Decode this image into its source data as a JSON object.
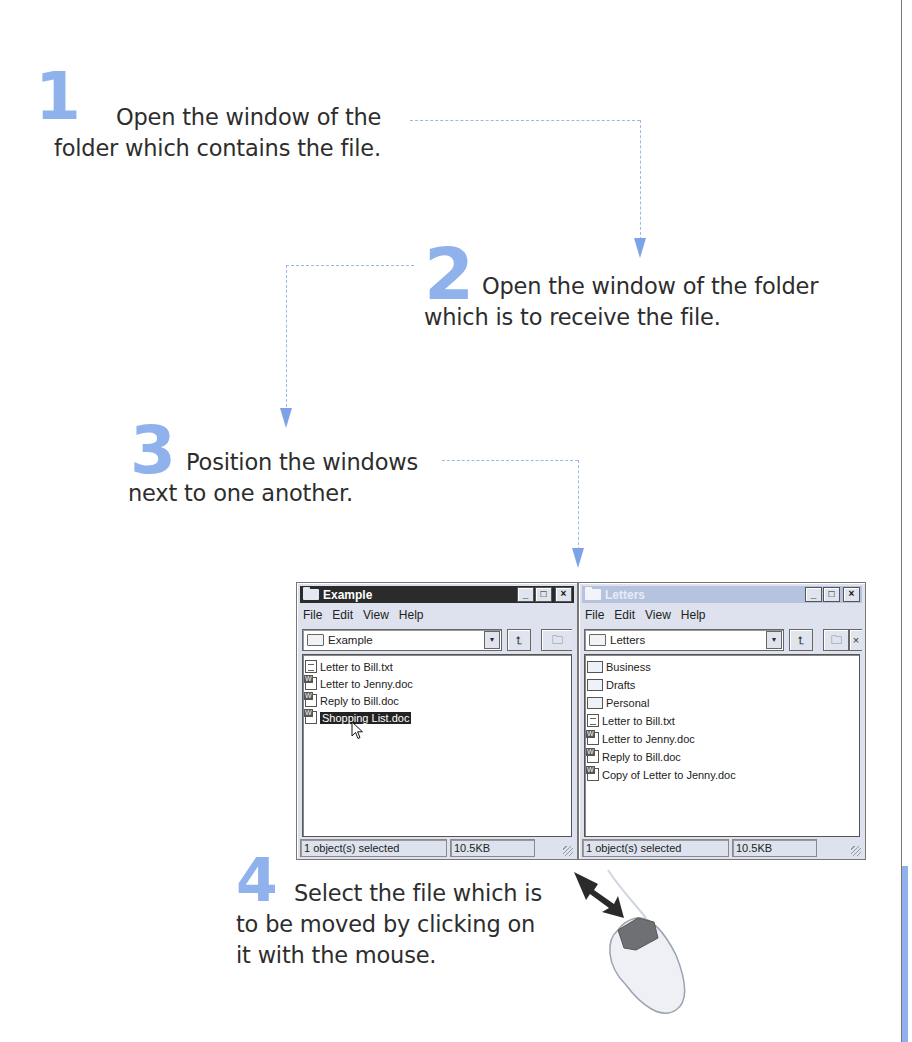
{
  "steps": [
    {
      "number": "1",
      "text_line1": "Open the window of the",
      "text_line2": "folder which contains the file."
    },
    {
      "number": "2",
      "text_line1": "Open the window of the folder",
      "text_line2": "which is to receive the file."
    },
    {
      "number": "3",
      "text_line1": "Position the windows",
      "text_line2": "next to one another."
    },
    {
      "number": "4",
      "text_line1": "Select the file which is",
      "text_line2": "to be moved by clicking on",
      "text_line3": "it with the mouse."
    }
  ],
  "colors": {
    "accent_blue": "#8fb2ec",
    "dashed_line": "#9db8e4",
    "active_titlebar": "#2b2b2b",
    "inactive_titlebar": "#b6c3de",
    "selection": "#222222"
  },
  "windows": [
    {
      "title": "Example",
      "state": "active",
      "menu": [
        "File",
        "Edit",
        "View",
        "Help"
      ],
      "address": "Example",
      "files": [
        {
          "name": "Letter to Bill.txt",
          "type": "txt"
        },
        {
          "name": "Letter to Jenny.doc",
          "type": "doc"
        },
        {
          "name": "Reply to Bill.doc",
          "type": "doc"
        },
        {
          "name": "Shopping List.doc",
          "type": "doc",
          "selected": true
        }
      ],
      "status_left": "1 object(s) selected",
      "status_size": "10.5KB"
    },
    {
      "title": "Letters",
      "state": "inactive",
      "menu": [
        "File",
        "Edit",
        "View",
        "Help"
      ],
      "address": "Letters",
      "files": [
        {
          "name": "Business",
          "type": "folder"
        },
        {
          "name": "Drafts",
          "type": "folder"
        },
        {
          "name": "Personal",
          "type": "folder"
        },
        {
          "name": "Letter to Bill.txt",
          "type": "txt"
        },
        {
          "name": "Letter to Jenny.doc",
          "type": "doc"
        },
        {
          "name": "Reply to Bill.doc",
          "type": "doc"
        },
        {
          "name": "Copy of Letter to Jenny.doc",
          "type": "doc"
        }
      ],
      "status_left": "1 object(s) selected",
      "status_size": "10.5KB"
    }
  ],
  "window_buttons": {
    "minimize": "_",
    "maximize": "□",
    "close": "×"
  },
  "icons": {
    "up_folder": "up-one-level-icon",
    "map_drive": "map-network-drive-icon",
    "dropdown": "▾",
    "mouse": "mouse-illustration",
    "pointer_arrow": "black-arrow-icon"
  }
}
